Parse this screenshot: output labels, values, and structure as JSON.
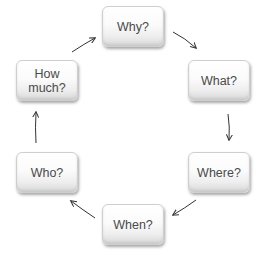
{
  "diagram": {
    "type": "cycle",
    "nodes": [
      {
        "id": "why",
        "label": "Why?",
        "x": 102,
        "y": 6
      },
      {
        "id": "what",
        "label": "What?",
        "x": 188,
        "y": 60
      },
      {
        "id": "where",
        "label": "Where?",
        "x": 188,
        "y": 152
      },
      {
        "id": "when",
        "label": "When?",
        "x": 102,
        "y": 204
      },
      {
        "id": "who",
        "label": "Who?",
        "x": 16,
        "y": 152
      },
      {
        "id": "how_much",
        "label": "How\nmuch?",
        "x": 16,
        "y": 60
      }
    ],
    "edges": [
      {
        "from": "why",
        "to": "what"
      },
      {
        "from": "what",
        "to": "where"
      },
      {
        "from": "where",
        "to": "when"
      },
      {
        "from": "when",
        "to": "who"
      },
      {
        "from": "who",
        "to": "how_much"
      },
      {
        "from": "how_much",
        "to": "why"
      }
    ],
    "colors": {
      "text": "#4a4a4a",
      "arrow": "#333333",
      "box_border": "#cfcfcf"
    }
  }
}
